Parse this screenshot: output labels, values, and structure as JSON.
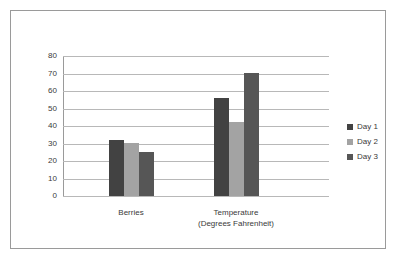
{
  "chart_data": {
    "type": "bar",
    "title": "",
    "xlabel": "",
    "ylabel": "",
    "categories": [
      "Berries",
      "Temperature\n(Degrees Fahrenheit)"
    ],
    "category_labels": [
      {
        "line1": "Berries",
        "line2": ""
      },
      {
        "line1": "Temperature",
        "line2": "(Degrees Fahrenheit)"
      }
    ],
    "series": [
      {
        "name": "Day 1",
        "color": "#424242",
        "values": [
          32,
          56
        ]
      },
      {
        "name": "Day 2",
        "color": "#a3a3a3",
        "values": [
          30,
          42
        ]
      },
      {
        "name": "Day 3",
        "color": "#565656",
        "values": [
          25,
          70
        ]
      }
    ],
    "ylim": [
      0,
      80
    ],
    "ytick_step": 10,
    "yticks": [
      "0",
      "10",
      "20",
      "30",
      "40",
      "50",
      "60",
      "70",
      "80"
    ],
    "grid": true,
    "legend_position": "right",
    "legend_entries": [
      "Day 1",
      "Day 2",
      "Day 3"
    ]
  },
  "colors": {
    "frame_border": "#9a9a9a",
    "gridline": "#b8b8b8",
    "axis": "#9a9a9a",
    "text": "#3a3a3a",
    "background": "#ffffff"
  }
}
